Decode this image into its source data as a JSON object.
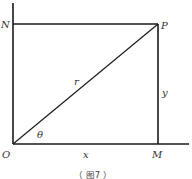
{
  "diagram": {
    "type": "coordinate-geometry",
    "caption": "（ 图7 ）",
    "line_color": "#1a1a1a",
    "points": {
      "origin": {
        "label": "O"
      },
      "N": {
        "label": "N"
      },
      "P": {
        "label": "P"
      },
      "M": {
        "label": "M"
      }
    },
    "segments": {
      "hypotenuse": {
        "label": "r"
      },
      "vertical_side": {
        "label": "y"
      },
      "horizontal_side": {
        "label": "x"
      }
    },
    "angle": {
      "label": "θ"
    }
  }
}
